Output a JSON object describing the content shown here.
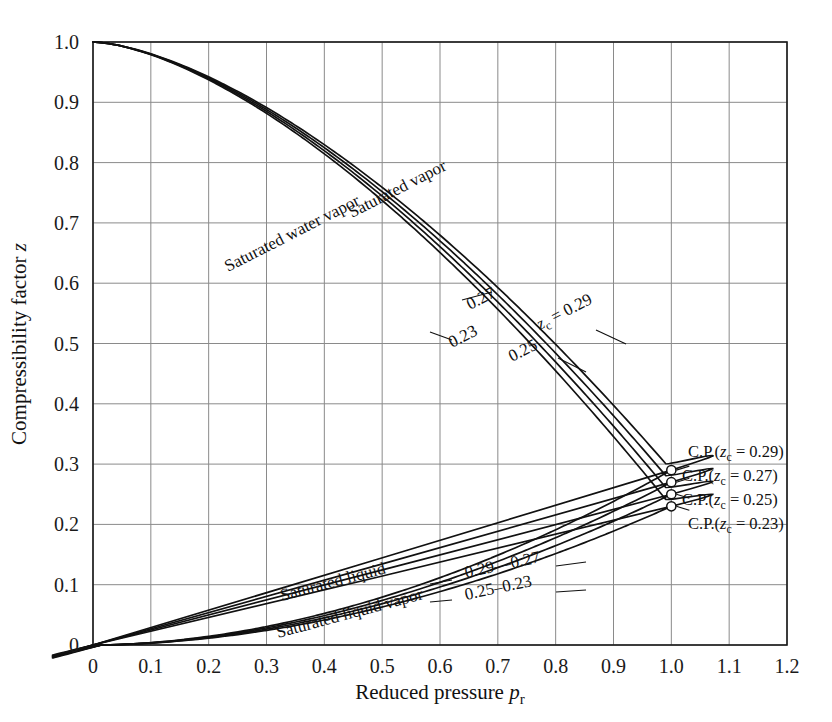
{
  "figure": {
    "title": "",
    "axes": {
      "x": {
        "label_main": "Reduced pressure",
        "label_symbol": "p",
        "label_subscript": "r",
        "ticks": [
          "0",
          "0.1",
          "0.2",
          "0.3",
          "0.4",
          "0.5",
          "0.6",
          "0.7",
          "0.8",
          "0.9",
          "1.0",
          "1.1",
          "1.2"
        ],
        "min": 0,
        "max": 1.2
      },
      "y": {
        "label_main": "Compressibility factor",
        "label_symbol": "z",
        "ticks": [
          "0",
          "0.1",
          "0.2",
          "0.3",
          "0.4",
          "0.5",
          "0.6",
          "0.7",
          "0.8",
          "0.9",
          "1.0"
        ],
        "min": 0,
        "max": 1.0
      }
    },
    "annotations": {
      "saturated_vapor": "Saturated vapor",
      "saturated_water_vapor": "Saturated water vapor",
      "saturated_liquid": "Saturated liquid",
      "saturated_liquid_vapor": "Saturated liquid vapor",
      "vapor_value_023": "0.23",
      "vapor_value_025": "0.25",
      "vapor_value_027": "0.27",
      "vapor_value_zc029": "z",
      "vapor_value_zc029_sub": "c",
      "vapor_value_zc029_rest": " = 0.29",
      "liquid_value_029": "0.29",
      "liquid_value_027": "0.27",
      "liquid_value_025": "0.25",
      "liquid_value_023": "0.23",
      "liquid_dash_top": "—",
      "liquid_dash_bottom": "–",
      "cp_prefix": "C.P.(",
      "cp_symbol": "z",
      "cp_subscript": "c",
      "cp_eq_029": " = 0.29)",
      "cp_eq_027": " = 0.27)",
      "cp_eq_025": " = 0.25)",
      "cp_eq_023": " = 0.23)"
    },
    "style": {
      "grid_color": "#8a8a8a",
      "frame_color": "#1a1a1a",
      "curve_color": "#111111",
      "background": "#ffffff"
    }
  },
  "chart_data": {
    "type": "line",
    "xlabel": "Reduced pressure p_r",
    "ylabel": "Compressibility factor z",
    "xlim": [
      0,
      1.2
    ],
    "ylim": [
      0,
      1.0
    ],
    "grid": true,
    "legend": "inline-labels",
    "critical_points": [
      {
        "name": "C.P.(zc = 0.29)",
        "zc": 0.29,
        "pr": 1.0,
        "z": 0.29
      },
      {
        "name": "C.P.(zc = 0.27)",
        "zc": 0.27,
        "pr": 1.0,
        "z": 0.27
      },
      {
        "name": "C.P.(zc = 0.25)",
        "zc": 0.25,
        "pr": 1.0,
        "z": 0.25
      },
      {
        "name": "C.P.(zc = 0.23)",
        "zc": 0.23,
        "pr": 1.0,
        "z": 0.23
      }
    ],
    "series": [
      {
        "name": "Saturated vapor zc = 0.29",
        "zc": 0.29,
        "branch": "vapor",
        "x": [
          0.0,
          0.02,
          0.05,
          0.1,
          0.15,
          0.2,
          0.25,
          0.3,
          0.35,
          0.4,
          0.45,
          0.5,
          0.55,
          0.6,
          0.65,
          0.7,
          0.75,
          0.8,
          0.85,
          0.9,
          0.93,
          0.96,
          0.98,
          0.99,
          1.0
        ],
        "y": [
          1.0,
          0.975,
          0.945,
          0.9,
          0.862,
          0.827,
          0.793,
          0.76,
          0.727,
          0.694,
          0.661,
          0.627,
          0.593,
          0.558,
          0.521,
          0.483,
          0.443,
          0.4,
          0.554,
          0.5,
          0.36,
          0.33,
          0.31,
          0.3,
          0.29
        ]
      },
      {
        "name": "Saturated vapor zc = 0.27",
        "zc": 0.27,
        "branch": "vapor",
        "x": [
          0.0,
          0.02,
          0.05,
          0.1,
          0.15,
          0.2,
          0.25,
          0.3,
          0.35,
          0.4,
          0.45,
          0.5,
          0.55,
          0.6,
          0.65,
          0.7,
          0.75,
          0.8,
          0.85,
          0.9,
          0.95,
          0.98,
          1.0
        ],
        "y": [
          1.0,
          0.972,
          0.94,
          0.895,
          0.855,
          0.818,
          0.783,
          0.748,
          0.714,
          0.679,
          0.644,
          0.609,
          0.573,
          0.536,
          0.498,
          0.458,
          0.416,
          0.372,
          0.34,
          0.31,
          0.285,
          0.275,
          0.27
        ]
      },
      {
        "name": "Saturated vapor zc = 0.25",
        "zc": 0.25,
        "branch": "vapor",
        "x": [
          0.0,
          0.02,
          0.05,
          0.1,
          0.15,
          0.2,
          0.25,
          0.3,
          0.35,
          0.4,
          0.45,
          0.5,
          0.55,
          0.6,
          0.65,
          0.7,
          0.75,
          0.8,
          0.85,
          0.9,
          0.95,
          0.98,
          1.0
        ],
        "y": [
          1.0,
          0.97,
          0.936,
          0.89,
          0.848,
          0.81,
          0.773,
          0.737,
          0.701,
          0.665,
          0.629,
          0.592,
          0.555,
          0.517,
          0.477,
          0.436,
          0.393,
          0.348,
          0.315,
          0.288,
          0.265,
          0.255,
          0.25
        ]
      },
      {
        "name": "Saturated water vapor zc = 0.23",
        "zc": 0.23,
        "branch": "vapor",
        "x": [
          0.0,
          0.02,
          0.05,
          0.1,
          0.15,
          0.2,
          0.25,
          0.3,
          0.35,
          0.4,
          0.45,
          0.5,
          0.55,
          0.6,
          0.65,
          0.7,
          0.75,
          0.8,
          0.85,
          0.9,
          0.95,
          0.98,
          1.0
        ],
        "y": [
          1.0,
          0.965,
          0.925,
          0.877,
          0.833,
          0.793,
          0.754,
          0.716,
          0.678,
          0.64,
          0.602,
          0.564,
          0.525,
          0.485,
          0.444,
          0.402,
          0.358,
          0.315,
          0.285,
          0.262,
          0.243,
          0.235,
          0.23
        ]
      },
      {
        "name": "Saturated liquid zc = 0.29",
        "zc": 0.29,
        "branch": "liquid",
        "x": [
          0.0,
          0.05,
          0.1,
          0.15,
          0.2,
          0.25,
          0.3,
          0.35,
          0.4,
          0.45,
          0.5,
          0.55,
          0.6,
          0.65,
          0.7,
          0.75,
          0.8,
          0.85,
          0.9,
          0.95,
          0.98,
          1.0
        ],
        "y": [
          0.0,
          0.011,
          0.022,
          0.033,
          0.044,
          0.055,
          0.066,
          0.078,
          0.089,
          0.101,
          0.113,
          0.125,
          0.138,
          0.151,
          0.165,
          0.18,
          0.196,
          0.214,
          0.235,
          0.262,
          0.278,
          0.29
        ]
      },
      {
        "name": "Saturated liquid zc = 0.27",
        "zc": 0.27,
        "branch": "liquid",
        "x": [
          0.0,
          0.05,
          0.1,
          0.15,
          0.2,
          0.25,
          0.3,
          0.35,
          0.4,
          0.45,
          0.5,
          0.55,
          0.6,
          0.65,
          0.7,
          0.75,
          0.8,
          0.85,
          0.9,
          0.95,
          0.98,
          1.0
        ],
        "y": [
          0.0,
          0.0102,
          0.0205,
          0.0308,
          0.0412,
          0.0516,
          0.0622,
          0.0729,
          0.0838,
          0.0949,
          0.106,
          0.118,
          0.13,
          0.142,
          0.155,
          0.169,
          0.184,
          0.201,
          0.221,
          0.246,
          0.261,
          0.27
        ]
      },
      {
        "name": "Saturated liquid zc = 0.25",
        "zc": 0.25,
        "branch": "liquid",
        "x": [
          0.0,
          0.05,
          0.1,
          0.15,
          0.2,
          0.25,
          0.3,
          0.35,
          0.4,
          0.45,
          0.5,
          0.55,
          0.6,
          0.65,
          0.7,
          0.75,
          0.8,
          0.85,
          0.9,
          0.95,
          0.98,
          1.0
        ],
        "y": [
          0.0,
          0.0094,
          0.0189,
          0.0285,
          0.0381,
          0.0478,
          0.0576,
          0.0675,
          0.0776,
          0.0879,
          0.0984,
          0.109,
          0.12,
          0.132,
          0.144,
          0.157,
          0.171,
          0.187,
          0.205,
          0.228,
          0.241,
          0.25
        ]
      },
      {
        "name": "Saturated liquid vapor zc = 0.23",
        "zc": 0.23,
        "branch": "liquid",
        "x": [
          0.0,
          0.05,
          0.1,
          0.15,
          0.2,
          0.25,
          0.3,
          0.35,
          0.4,
          0.45,
          0.5,
          0.55,
          0.6,
          0.65,
          0.7,
          0.75,
          0.8,
          0.85,
          0.9,
          0.95,
          0.98,
          1.0
        ],
        "y": [
          0.0,
          0.0086,
          0.0173,
          0.0261,
          0.0349,
          0.0438,
          0.0528,
          0.0619,
          0.0712,
          0.0806,
          0.0902,
          0.1,
          0.11,
          0.121,
          0.132,
          0.144,
          0.157,
          0.172,
          0.189,
          0.21,
          0.222,
          0.23
        ]
      }
    ]
  }
}
